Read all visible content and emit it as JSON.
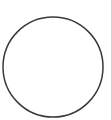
{
  "chart_title": "",
  "figure": {
    "width": 111,
    "height": 120,
    "background": "#ffffff"
  },
  "chart_data": {
    "type": "pie",
    "title": "",
    "subtitle": "",
    "xlabel": "",
    "ylabel": "",
    "grid": false,
    "legend": "none",
    "labels_shown": false,
    "start_angle_deg": 90,
    "direction": "clockwise",
    "center_px": [
      53,
      67
    ],
    "radius_px": 50,
    "categories": [
      "Slice 1",
      "Slice 2",
      "Slice 3",
      "Slice 4"
    ],
    "values": [
      8,
      17,
      14,
      61
    ],
    "units": "percent",
    "slice_angles_deg": [
      30,
      60,
      50,
      220
    ],
    "slice_boundaries_deg": [
      0,
      30,
      90,
      140,
      360
    ],
    "colors": [
      "#ffffff",
      "#ffffff",
      "#ffffff",
      "#ffffff"
    ],
    "outline_color": "#3a3a3a",
    "divider_color": "#7d7d7d",
    "annotations": []
  }
}
